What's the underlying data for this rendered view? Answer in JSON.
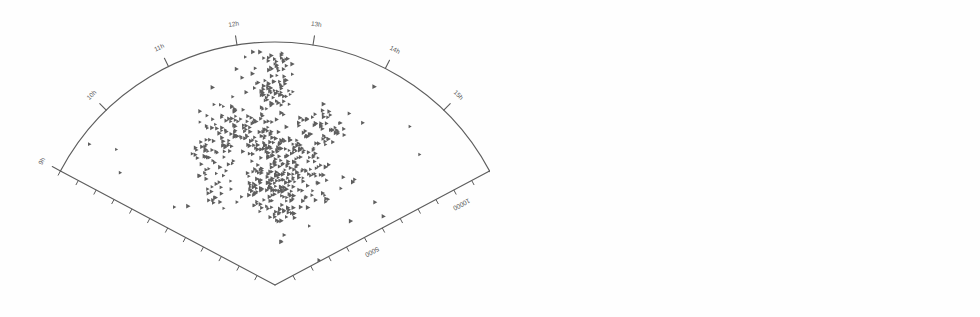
{
  "figure": {
    "title": "",
    "panels": [
      {
        "id": "left",
        "name": "galaxy-distribution-cone",
        "caption": "",
        "content_type": "scatter-points"
      },
      {
        "id": "right",
        "name": "filament-skeleton-cone",
        "caption": "",
        "content_type": "skeleton-curves"
      }
    ]
  },
  "chart_data": {
    "type": "scatter",
    "title": "",
    "xlabel": "",
    "ylabel": "",
    "projection": "polar-wedge",
    "geometry": {
      "apex_deg_span": 124,
      "angle_start_deg": 208,
      "angle_end_deg": 332,
      "radial_max": 12000,
      "radial_units": "km/s"
    },
    "angular_axis": {
      "name": "right-ascension",
      "unit": "hours",
      "tick_labels": [
        "9h",
        "10h",
        "11h",
        "12h",
        "13h",
        "14h",
        "15h",
        "16h"
      ],
      "tick_angles_deg": [
        208,
        226,
        244,
        261,
        279,
        297,
        314,
        332
      ]
    },
    "radial_axis": {
      "name": "velocity",
      "unit": "km/s",
      "tick_labels": [
        "5000",
        "10000"
      ],
      "tick_values": [
        5000,
        10000
      ],
      "minor_tick_step": 1000
    },
    "series": [
      {
        "name": "galaxies",
        "panel": "left",
        "marker": "triangle",
        "color": "#5e5e5e",
        "count": 612
      },
      {
        "name": "filaments",
        "panel": "right",
        "marker": "line",
        "color": "#6a6a6a",
        "count": 9
      }
    ],
    "legend": [],
    "grid": false
  },
  "colors": {
    "ink": "#5d5d5d",
    "marker": "#5e5e5e",
    "skeleton": "#6a6a6a",
    "background": "#ffffff"
  }
}
